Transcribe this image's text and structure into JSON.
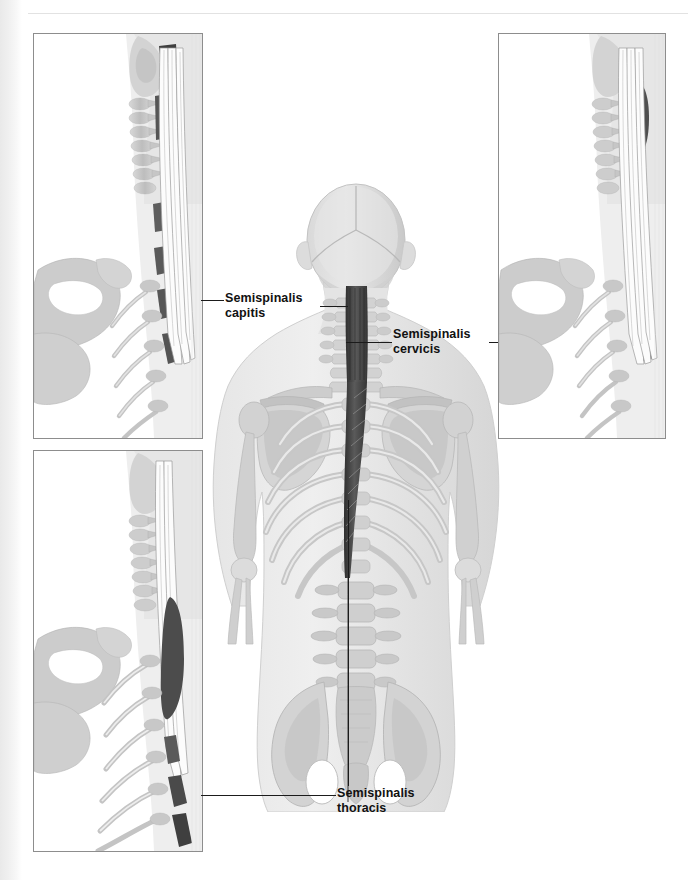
{
  "plate": {
    "title": "Semispinalis muscle group",
    "view": "posterior view of trunk with three lateral inset panels",
    "background_color": "#ffffff",
    "ink_color": "#111111",
    "bone_color": "#c9c9c9",
    "body_color": "#e3e3e3",
    "muscle_highlight_color": "#4a4a4a",
    "panel_border_color": "#8d8d8d"
  },
  "labels": {
    "capitis": {
      "line1": "Semispinalis",
      "line2": "capitis"
    },
    "cervicis": {
      "line1": "Semispinalis",
      "line2": "cervicis"
    },
    "thoracis": {
      "line1": "Semispinalis",
      "line2": "thoracis"
    }
  },
  "panels": [
    {
      "id": "panel-top-left",
      "caption_target": "capitis",
      "description": "Lateral cervical spine and scapula, semispinalis capitis highlighted"
    },
    {
      "id": "panel-top-right",
      "caption_target": "cervicis",
      "description": "Lateral cervical spine and scapula, semispinalis cervicis highlighted"
    },
    {
      "id": "panel-bottom-left",
      "caption_target": "thoracis",
      "description": "Lateral thoracic spine and scapula, semispinalis thoracis highlighted"
    }
  ],
  "figure": {
    "name": "posterior-skeleton-figure",
    "regions": [
      "skull",
      "cervical-spine",
      "scapula",
      "rib-cage",
      "thoracic-spine",
      "lumbar-spine",
      "pelvis",
      "arms"
    ]
  }
}
